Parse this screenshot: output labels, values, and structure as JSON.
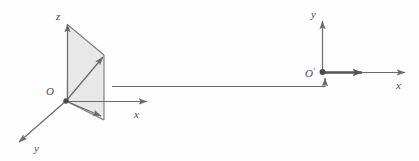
{
  "figure": {
    "background_color": "#fefefe",
    "stroke_color": "#6b6b6b",
    "bold_stroke_color": "#555555",
    "fill_color": "#e8e8e8",
    "label_color": "#4a4a4a",
    "width": 419,
    "height": 161
  },
  "left_diagram": {
    "name": "three-dimensional-coordinate-frame",
    "origin_label": "O",
    "axes": [
      {
        "name": "z",
        "label": "z",
        "direction": "up"
      },
      {
        "name": "x",
        "label": "x",
        "direction": "right"
      },
      {
        "name": "y",
        "label": "y",
        "direction": "down-left"
      }
    ],
    "shaded_region": {
      "name": "shaded-quadrilateral",
      "vertices": "68,25 104,55 104,120 66,101",
      "fill": "#e8e8e8"
    },
    "vectors": [
      {
        "name": "upper-diagonal-vector",
        "from": "66,101",
        "to": "103,57"
      },
      {
        "name": "lower-diagonal-vector",
        "from": "66,101",
        "to": "101,116"
      }
    ]
  },
  "connector": {
    "name": "projection-connector",
    "horizontal_from": "112,86",
    "horizontal_to": "325,86",
    "vertical_to": "325,77",
    "arrow_direction": "up"
  },
  "right_diagram": {
    "name": "two-dimensional-coordinate-frame",
    "origin_label": "O",
    "origin_prime": "′",
    "axes": [
      {
        "name": "y",
        "label": "y",
        "direction": "up"
      },
      {
        "name": "x",
        "label": "x",
        "direction": "right"
      }
    ],
    "bold_segment": {
      "name": "bold-x-vector",
      "from": "322,72",
      "to": "363,72"
    }
  }
}
